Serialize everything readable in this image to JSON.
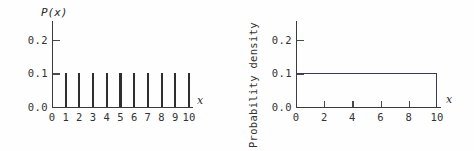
{
  "figure": {
    "background_color": "#fefefe",
    "ink_color": "#2e2e2e",
    "accent_color": "#3a3a55"
  },
  "chart_data": [
    {
      "type": "bar",
      "title": "",
      "ylabel": "P(x)",
      "xlabel": "x",
      "categories": [
        "1",
        "2",
        "3",
        "4",
        "5",
        "6",
        "7",
        "8",
        "9",
        "10"
      ],
      "x": [
        1,
        2,
        3,
        4,
        5,
        6,
        7,
        8,
        9,
        10
      ],
      "values": [
        0.1,
        0.1,
        0.1,
        0.1,
        0.1,
        0.1,
        0.1,
        0.1,
        0.1,
        0.1
      ],
      "xlim": [
        0,
        10
      ],
      "ylim": [
        0,
        0.25
      ],
      "grid": false,
      "legend": "none",
      "y_ticks": [
        {
          "value": 0.0,
          "label": "0.0"
        },
        {
          "value": 0.1,
          "label": "0.1"
        },
        {
          "value": 0.2,
          "label": "0.2"
        }
      ],
      "x_ticks": [
        {
          "value": 0,
          "label": "0"
        },
        {
          "value": 1,
          "label": "1"
        },
        {
          "value": 2,
          "label": "2"
        },
        {
          "value": 3,
          "label": "3"
        },
        {
          "value": 4,
          "label": "4"
        },
        {
          "value": 5,
          "label": "5"
        },
        {
          "value": 6,
          "label": "6"
        },
        {
          "value": 7,
          "label": "7"
        },
        {
          "value": 8,
          "label": "8"
        },
        {
          "value": 9,
          "label": "9"
        },
        {
          "value": 10,
          "label": "10"
        }
      ]
    },
    {
      "type": "area",
      "title": "",
      "ylabel": "Probability density",
      "xlabel": "x",
      "x": [
        0,
        10
      ],
      "values": [
        0.1,
        0.1
      ],
      "xlim": [
        0,
        10
      ],
      "ylim": [
        0,
        0.25
      ],
      "grid": false,
      "legend": "none",
      "y_ticks": [
        {
          "value": 0.0,
          "label": "0.0"
        },
        {
          "value": 0.1,
          "label": "0.1"
        },
        {
          "value": 0.2,
          "label": "0.2"
        }
      ],
      "x_ticks": [
        {
          "value": 0,
          "label": "0"
        },
        {
          "value": 2,
          "label": "2"
        },
        {
          "value": 4,
          "label": "4"
        },
        {
          "value": 6,
          "label": "6"
        },
        {
          "value": 8,
          "label": "8"
        },
        {
          "value": 10,
          "label": "10"
        }
      ]
    }
  ]
}
